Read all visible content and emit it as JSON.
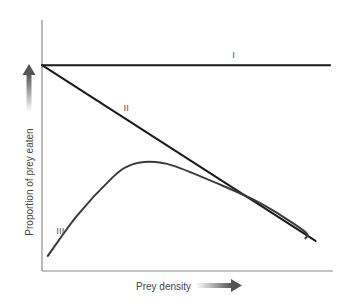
{
  "chart_data": {
    "type": "line",
    "title": "",
    "xlabel": "Prey density",
    "ylabel": "Proportion of prey eaten",
    "xlim": [
      0,
      100
    ],
    "ylim": [
      0,
      100
    ],
    "grid": false,
    "legend": "none",
    "x_arrow": "increasing-right",
    "y_arrow": "increasing-up",
    "series": [
      {
        "name": "I",
        "label": "I",
        "shape": "constant",
        "points": [
          [
            0,
            82
          ],
          [
            99,
            82
          ]
        ]
      },
      {
        "name": "II",
        "label": "II",
        "shape": "linear-decline",
        "points": [
          [
            0,
            82
          ],
          [
            94,
            12
          ]
        ]
      },
      {
        "name": "III",
        "label": "III",
        "shape": "rise-then-decline",
        "points": [
          [
            2,
            6
          ],
          [
            12,
            22
          ],
          [
            24,
            37
          ],
          [
            30,
            42
          ],
          [
            37,
            43.5
          ],
          [
            45,
            42
          ],
          [
            60,
            35
          ],
          [
            75,
            27
          ],
          [
            90,
            16
          ],
          [
            90.5,
            13
          ]
        ]
      }
    ]
  }
}
